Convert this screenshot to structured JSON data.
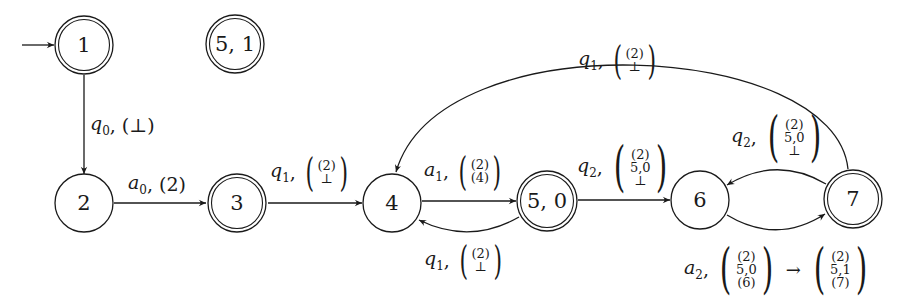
{
  "diagram": {
    "type": "automaton",
    "nodes": [
      {
        "id": "1",
        "label": "1",
        "accepting": true,
        "initial": true
      },
      {
        "id": "51",
        "label": "5, 1",
        "accepting": true,
        "initial": false
      },
      {
        "id": "2",
        "label": "2",
        "accepting": false,
        "initial": false
      },
      {
        "id": "3",
        "label": "3",
        "accepting": true,
        "initial": false
      },
      {
        "id": "4",
        "label": "4",
        "accepting": false,
        "initial": false
      },
      {
        "id": "50",
        "label": "5, 0",
        "accepting": true,
        "initial": false
      },
      {
        "id": "6",
        "label": "6",
        "accepting": false,
        "initial": false
      },
      {
        "id": "7",
        "label": "7",
        "accepting": true,
        "initial": false
      }
    ],
    "edges": [
      {
        "from": "1",
        "to": "2",
        "symbol": "q",
        "sub": "0",
        "stack": [
          "⊥"
        ],
        "inline": "(⊥)"
      },
      {
        "from": "2",
        "to": "3",
        "symbol": "a",
        "sub": "0",
        "stack": [
          "(2)"
        ],
        "inline": "(2)"
      },
      {
        "from": "3",
        "to": "4",
        "symbol": "q",
        "sub": "1",
        "stack": [
          "(2)",
          "⊥"
        ]
      },
      {
        "from": "4",
        "to": "50",
        "symbol": "a",
        "sub": "1",
        "stack": [
          "(2)",
          "(4)"
        ]
      },
      {
        "from": "50",
        "to": "4",
        "symbol": "q",
        "sub": "1",
        "stack": [
          "(2)",
          "⊥"
        ]
      },
      {
        "from": "50",
        "to": "6",
        "symbol": "q",
        "sub": "2",
        "stack": [
          "(2)",
          "5,0",
          "⊥"
        ]
      },
      {
        "from": "7",
        "to": "6",
        "symbol": "q",
        "sub": "2",
        "stack": [
          "(2)",
          "5,0",
          "⊥"
        ]
      },
      {
        "from": "6",
        "to": "7",
        "symbol": "a",
        "sub": "2",
        "stack": [
          "(2)",
          "5,0",
          "(6)"
        ],
        "arrow": "→",
        "stack_after": [
          "(2)",
          "5,1",
          "(7)"
        ]
      },
      {
        "from": "7",
        "to": "4",
        "symbol": "q",
        "sub": "1",
        "stack": [
          "(2)",
          "⊥"
        ]
      }
    ]
  },
  "labels": {
    "n1": "1",
    "n51": "5, 1",
    "n2": "2",
    "n3": "3",
    "n4": "4",
    "n50": "5, 0",
    "n6": "6",
    "n7": "7",
    "e12": {
      "sym": "q",
      "sub": "0",
      "comma": ",",
      "paren": "(⊥)"
    },
    "e23": {
      "sym": "a",
      "sub": "0",
      "comma": ",",
      "paren": "(2)"
    },
    "e34": {
      "sym": "q",
      "sub": "1",
      "comma": ",",
      "v0": "(2)",
      "v1": "⊥"
    },
    "e4_50": {
      "sym": "a",
      "sub": "1",
      "comma": ",",
      "v0": "(2)",
      "v1": "(4)"
    },
    "e50_4": {
      "sym": "q",
      "sub": "1",
      "comma": ",",
      "v0": "(2)",
      "v1": "⊥"
    },
    "e50_6": {
      "sym": "q",
      "sub": "2",
      "comma": ",",
      "v0": "(2)",
      "v1": "5,0",
      "v2": "⊥"
    },
    "e76": {
      "sym": "q",
      "sub": "2",
      "comma": ",",
      "v0": "(2)",
      "v1": "5,0",
      "v2": "⊥"
    },
    "e67": {
      "sym": "a",
      "sub": "2",
      "comma": ",",
      "v0": "(2)",
      "v1": "5,0",
      "v2": "(6)",
      "arrow": "→",
      "w0": "(2)",
      "w1": "5,1",
      "w2": "(7)"
    },
    "e74": {
      "sym": "q",
      "sub": "1",
      "comma": ",",
      "v0": "(2)",
      "v1": "⊥"
    }
  },
  "brackets": {
    "open": "(",
    "close": ")"
  }
}
